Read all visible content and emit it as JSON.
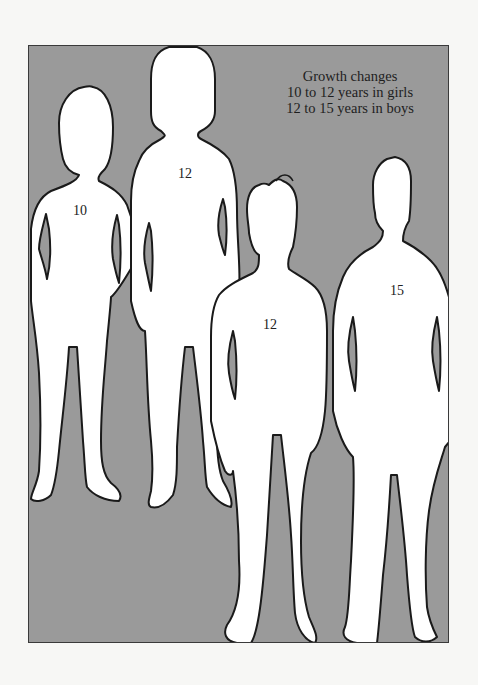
{
  "caption": {
    "title": "Growth changes",
    "line_girls": "10 to 12 years in girls",
    "line_boys": "12 to 15 years in boys"
  },
  "figures": [
    {
      "id": "girl-10",
      "sex": "girl",
      "age_label": "10"
    },
    {
      "id": "girl-12",
      "sex": "girl",
      "age_label": "12"
    },
    {
      "id": "boy-12",
      "sex": "boy",
      "age_label": "12"
    },
    {
      "id": "boy-15",
      "sex": "boy",
      "age_label": "15"
    }
  ],
  "colors": {
    "background": "#9a9a9a",
    "silhouette_fill": "#ffffff",
    "outline": "#1a1a1a",
    "page": "#f7f7f5"
  }
}
